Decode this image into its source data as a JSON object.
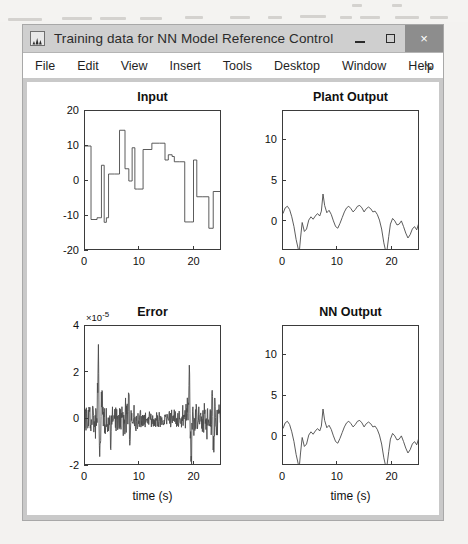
{
  "window": {
    "title": "Training data for NN Model Reference Control",
    "icon": "matlab-figure-icon",
    "buttons": {
      "minimize": "minimize",
      "maximize": "maximize",
      "close": "×"
    }
  },
  "menubar": {
    "items": [
      "File",
      "Edit",
      "View",
      "Insert",
      "Tools",
      "Desktop",
      "Window",
      "Help"
    ],
    "dock_arrow": "↘"
  },
  "chart_data": [
    {
      "id": "input",
      "type": "line",
      "title": "Input",
      "xlabel": "",
      "ylabel": "",
      "xlim": [
        0,
        25
      ],
      "ylim": [
        -20,
        20
      ],
      "xticks": [
        0,
        10,
        20
      ],
      "yticks": [
        20,
        10,
        0,
        -10,
        -20
      ],
      "grid": false,
      "line_color": "#4a4a4a",
      "step": true,
      "x": [
        0,
        1.1,
        1.1,
        2.2,
        2.2,
        3.0,
        3.0,
        3.5,
        3.5,
        3.9,
        3.9,
        4.3,
        4.3,
        5.4,
        5.4,
        6.3,
        6.3,
        7.3,
        7.3,
        8.0,
        8.0,
        8.6,
        8.6,
        9.1,
        9.1,
        9.6,
        9.6,
        10.6,
        10.6,
        12.2,
        12.2,
        13.6,
        13.6,
        14.6,
        14.6,
        15.2,
        15.2,
        15.9,
        15.9,
        16.3,
        16.3,
        17.3,
        17.3,
        18.2,
        18.2,
        19.2,
        19.2,
        19.8,
        19.8,
        20.4,
        20.4,
        21.5,
        21.5,
        22.6,
        22.6,
        23.4,
        23.4,
        25
      ],
      "y": [
        10,
        10,
        -11,
        -11,
        -10.5,
        -10.5,
        4.5,
        4.5,
        -11.8,
        -11.8,
        -10.5,
        -10.5,
        2,
        2,
        2,
        2,
        14.5,
        14.5,
        3.5,
        3.5,
        0,
        0,
        9.5,
        9.5,
        -2.3,
        -2.3,
        -2.3,
        -2.3,
        9,
        9,
        10.8,
        10.8,
        10.8,
        10.8,
        6,
        6,
        7.5,
        7.5,
        7,
        7,
        5.5,
        5.5,
        5.5,
        5.5,
        -11.7,
        -11.7,
        -11.7,
        -11.7,
        6,
        6,
        -4.5,
        -4.5,
        -4.5,
        -4.5,
        -13.5,
        -13.5,
        -3,
        -3
      ]
    },
    {
      "id": "plant_output",
      "type": "line",
      "title": "Plant Output",
      "xlabel": "",
      "ylabel": "",
      "xlim": [
        0,
        25
      ],
      "ylim": [
        -3.6,
        13.6
      ],
      "xticks": [
        0,
        10,
        20
      ],
      "yticks": [
        10,
        5,
        0
      ],
      "grid": false,
      "line_color": "#4a4a4a",
      "step": false,
      "x": [
        0,
        0.4,
        0.8,
        1.2,
        1.6,
        2.0,
        2.4,
        2.8,
        3.0,
        3.2,
        3.5,
        3.9,
        4.3,
        4.7,
        5.1,
        5.5,
        5.9,
        6.3,
        6.7,
        7.0,
        7.3,
        7.6,
        8.0,
        8.4,
        8.8,
        9.2,
        9.6,
        10.0,
        10.4,
        10.8,
        11.2,
        11.6,
        12.0,
        12.4,
        12.8,
        13.2,
        13.6,
        14.0,
        14.4,
        14.8,
        15.2,
        15.6,
        16.0,
        16.4,
        16.8,
        17.2,
        17.6,
        18.0,
        18.4,
        18.7,
        19.0,
        19.3,
        19.6,
        20.0,
        20.4,
        20.8,
        21.2,
        21.6,
        22.0,
        22.4,
        22.8,
        23.2,
        23.6,
        24.0,
        24.4,
        25.0
      ],
      "y": [
        1.0,
        1.7,
        1.9,
        1.5,
        0.6,
        -0.6,
        -2.2,
        -3.4,
        -3.5,
        -2.0,
        -0.1,
        -1.2,
        -0.9,
        0.2,
        0.6,
        0.3,
        0.7,
        1.0,
        0.7,
        1.3,
        3.4,
        2.0,
        1.1,
        1.4,
        0.9,
        0.1,
        -0.6,
        -0.8,
        -0.2,
        0.5,
        1.2,
        1.7,
        1.9,
        1.6,
        1.2,
        1.5,
        1.9,
        2.0,
        1.7,
        1.2,
        1.6,
        1.8,
        1.6,
        1.2,
        1.3,
        0.9,
        0.2,
        -0.9,
        -2.6,
        -3.5,
        -3.4,
        -1.8,
        -0.3,
        0.4,
        0.1,
        -0.4,
        -0.3,
        0.1,
        -0.6,
        -1.4,
        -2.0,
        -1.6,
        -0.9,
        -0.6,
        -1.0,
        0.3
      ]
    },
    {
      "id": "error",
      "type": "line",
      "title": "Error",
      "exponent": "×10",
      "exponent_power": "-5",
      "xlabel": "time (s)",
      "ylabel": "",
      "xlim": [
        0,
        25
      ],
      "ylim": [
        -2,
        4
      ],
      "xticks": [
        0,
        10,
        20
      ],
      "yticks": [
        4,
        2,
        0,
        -2
      ],
      "grid": false,
      "line_color": "#4a4a4a",
      "step": false,
      "noise_seed": 7,
      "description": "high-frequency noise centered near 0 with spike bursts near t=2.5, t=8, t=19, t=23",
      "spikes": [
        {
          "t": 2.4,
          "amp": 2.4
        },
        {
          "t": 2.7,
          "amp": -1.3
        },
        {
          "t": 3.1,
          "amp": 1.5
        },
        {
          "t": 4.7,
          "amp": -1.0
        },
        {
          "t": 8.0,
          "amp": 1.1
        },
        {
          "t": 8.2,
          "amp": -1.5
        },
        {
          "t": 19.0,
          "amp": 1.9
        },
        {
          "t": 19.4,
          "amp": -1.6
        },
        {
          "t": 23.2,
          "amp": 1.2
        },
        {
          "t": 23.5,
          "amp": -1.6
        }
      ]
    },
    {
      "id": "nn_output",
      "type": "line",
      "title": "NN Output",
      "xlabel": "time (s)",
      "ylabel": "",
      "xlim": [
        0,
        25
      ],
      "ylim": [
        -3.6,
        13.6
      ],
      "xticks": [
        0,
        10,
        20
      ],
      "yticks": [
        10,
        5,
        0
      ],
      "grid": false,
      "line_color": "#4a4a4a",
      "step": false,
      "x": [
        0,
        0.4,
        0.8,
        1.2,
        1.6,
        2.0,
        2.4,
        2.8,
        3.0,
        3.2,
        3.5,
        3.9,
        4.3,
        4.7,
        5.1,
        5.5,
        5.9,
        6.3,
        6.7,
        7.0,
        7.3,
        7.6,
        8.0,
        8.4,
        8.8,
        9.2,
        9.6,
        10.0,
        10.4,
        10.8,
        11.2,
        11.6,
        12.0,
        12.4,
        12.8,
        13.2,
        13.6,
        14.0,
        14.4,
        14.8,
        15.2,
        15.6,
        16.0,
        16.4,
        16.8,
        17.2,
        17.6,
        18.0,
        18.4,
        18.7,
        19.0,
        19.3,
        19.6,
        20.0,
        20.4,
        20.8,
        21.2,
        21.6,
        22.0,
        22.4,
        22.8,
        23.2,
        23.6,
        24.0,
        24.4,
        25.0
      ],
      "y": [
        1.0,
        1.7,
        1.9,
        1.5,
        0.6,
        -0.6,
        -2.2,
        -3.4,
        -3.5,
        -2.0,
        -0.1,
        -1.2,
        -0.9,
        0.2,
        0.6,
        0.3,
        0.7,
        1.0,
        0.7,
        1.3,
        3.4,
        2.0,
        1.1,
        1.4,
        0.9,
        0.1,
        -0.6,
        -0.8,
        -0.2,
        0.5,
        1.2,
        1.7,
        1.9,
        1.6,
        1.2,
        1.5,
        1.9,
        2.0,
        1.7,
        1.2,
        1.6,
        1.8,
        1.6,
        1.2,
        1.3,
        0.9,
        0.2,
        -0.9,
        -2.6,
        -3.5,
        -3.4,
        -1.8,
        -0.3,
        0.4,
        0.1,
        -0.4,
        -0.3,
        0.1,
        -0.6,
        -1.4,
        -2.0,
        -1.6,
        -0.9,
        -0.6,
        -1.0,
        0.3
      ]
    }
  ],
  "colors": {
    "titlebar": "#cfcfcf",
    "close_button": "#8d8d8d",
    "window_bg": "#c9c9c9",
    "figure_bg": "#ffffff",
    "axis": "#3b3b3b",
    "line": "#4a4a4a"
  }
}
